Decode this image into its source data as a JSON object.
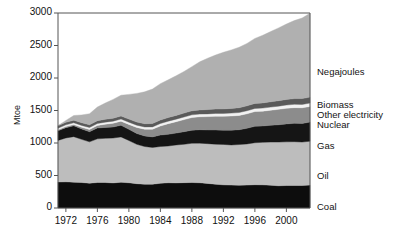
{
  "chart_data": {
    "type": "area",
    "title": "",
    "subtitle": "",
    "xlabel": "",
    "ylabel": "Mtoe",
    "ylim": [
      0,
      3000
    ],
    "xlim": [
      1971,
      2003
    ],
    "yticks": [
      "0",
      "500",
      "1000",
      "1500",
      "2000",
      "2500",
      "3000"
    ],
    "ytick_values": [
      0,
      500,
      1000,
      1500,
      2000,
      2500,
      3000
    ],
    "xticks": [
      "1972",
      "1976",
      "1980",
      "1984",
      "1988",
      "1992",
      "1996",
      "2000"
    ],
    "xtick_values": [
      1972,
      1976,
      1980,
      1984,
      1988,
      1992,
      1996,
      2000
    ],
    "grid": false,
    "stacked": true,
    "legend_position": "right-inline",
    "x": [
      1971,
      1972,
      1973,
      1974,
      1975,
      1976,
      1977,
      1978,
      1979,
      1980,
      1981,
      1982,
      1983,
      1984,
      1985,
      1986,
      1987,
      1988,
      1989,
      1990,
      1991,
      1992,
      1993,
      1994,
      1995,
      1996,
      1997,
      1998,
      1999,
      2000,
      2001,
      2002,
      2003
    ],
    "series": [
      {
        "name": "Coal",
        "color": "#0d0d0d",
        "values": [
          400,
          402,
          398,
          392,
          382,
          392,
          392,
          386,
          396,
          388,
          374,
          366,
          366,
          380,
          388,
          386,
          390,
          392,
          388,
          378,
          366,
          356,
          352,
          350,
          352,
          358,
          356,
          350,
          342,
          346,
          348,
          346,
          352
        ]
      },
      {
        "name": "Oil",
        "color": "#bdbdbd",
        "values": [
          640,
          676,
          700,
          664,
          636,
          672,
          680,
          690,
          698,
          650,
          606,
          580,
          566,
          566,
          566,
          584,
          590,
          604,
          610,
          612,
          616,
          622,
          618,
          626,
          634,
          646,
          654,
          664,
          672,
          672,
          672,
          668,
          676
        ]
      },
      {
        "name": "Gas",
        "color": "#151515",
        "values": [
          150,
          158,
          166,
          160,
          156,
          166,
          168,
          170,
          178,
          172,
          166,
          162,
          162,
          176,
          180,
          182,
          194,
          200,
          206,
          210,
          218,
          220,
          228,
          228,
          240,
          252,
          252,
          258,
          266,
          276,
          282,
          286,
          294
        ]
      },
      {
        "name": "Nuclear",
        "color": "#8c8c8c",
        "values": [
          12,
          16,
          20,
          26,
          34,
          40,
          50,
          58,
          64,
          76,
          94,
          104,
          118,
          140,
          164,
          176,
          186,
          196,
          200,
          206,
          212,
          214,
          218,
          220,
          224,
          228,
          228,
          232,
          238,
          240,
          242,
          242,
          240
        ]
      },
      {
        "name": "Other electricity",
        "color": "#f2f2f2",
        "values": [
          26,
          27,
          27,
          29,
          30,
          30,
          31,
          32,
          33,
          34,
          34,
          35,
          36,
          37,
          38,
          39,
          40,
          41,
          41,
          42,
          43,
          43,
          44,
          45,
          46,
          47,
          47,
          48,
          49,
          50,
          51,
          51,
          52
        ]
      },
      {
        "name": "Biomass",
        "color": "#5a5a5a",
        "values": [
          38,
          39,
          40,
          41,
          42,
          43,
          44,
          45,
          46,
          48,
          49,
          50,
          52,
          54,
          56,
          58,
          60,
          62,
          64,
          66,
          68,
          70,
          72,
          74,
          76,
          78,
          80,
          82,
          84,
          86,
          88,
          90,
          92
        ]
      },
      {
        "name": "Negajoules",
        "color": "#b0b0b0",
        "values": [
          0,
          30,
          72,
          120,
          170,
          210,
          250,
          290,
          320,
          380,
          440,
          490,
          530,
          560,
          580,
          610,
          640,
          680,
          740,
          790,
          830,
          870,
          900,
          930,
          960,
          1000,
          1040,
          1080,
          1120,
          1160,
          1200,
          1240,
          1290
        ]
      }
    ],
    "legend": [
      {
        "label": "Negajoules",
        "color": "#b0b0b0",
        "y": 66
      },
      {
        "label": "Biomass",
        "color": "#5a5a5a",
        "y": 99
      },
      {
        "label": "Other electricity",
        "color": "#f2f2f2",
        "y": 109
      },
      {
        "label": "Nuclear",
        "color": "#8c8c8c",
        "y": 119
      },
      {
        "label": "Gas",
        "color": "#151515",
        "y": 140
      },
      {
        "label": "Oil",
        "color": "#bdbdbd",
        "y": 170
      },
      {
        "label": "Coal",
        "color": "#0d0d0d",
        "y": 201
      }
    ],
    "plot_box": {
      "left": 58,
      "top": 13,
      "right": 310,
      "bottom": 208
    },
    "axis_color": "#555555",
    "background": "#ffffff"
  }
}
